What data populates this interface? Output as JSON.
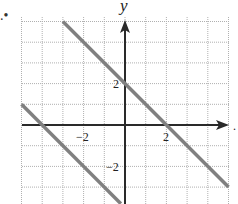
{
  "problem": {
    "bullet": ".•",
    "trailing_mark": "."
  },
  "axes": {
    "y_label": "y",
    "x_ticks": [
      {
        "value": -2,
        "label": "−2"
      },
      {
        "value": 2,
        "label": "2"
      }
    ],
    "y_ticks": [
      {
        "value": 2,
        "label": "2"
      },
      {
        "value": -2,
        "label": "−2"
      }
    ]
  },
  "chart_data": {
    "type": "line",
    "title": "",
    "xlabel": "",
    "ylabel": "y",
    "xlim": [
      -5,
      5
    ],
    "ylim": [
      -3.8,
      5
    ],
    "grid": true,
    "grid_step": 1,
    "x_tick_labels": [
      "-2",
      "2"
    ],
    "y_tick_labels": [
      "2",
      "-2"
    ],
    "series": [
      {
        "name": "upper line",
        "equation": "y = -x + 2",
        "points": [
          [
            -3,
            5
          ],
          [
            5,
            -3
          ]
        ],
        "color": "#808080"
      },
      {
        "name": "lower line",
        "equation": "y = -x - 4",
        "points": [
          [
            -5,
            1
          ],
          [
            -0.2,
            -3.8
          ]
        ],
        "color": "#808080"
      }
    ]
  },
  "colors": {
    "grid": "#b0b0b0",
    "axis": "#2a2a2a",
    "line": "#7a7a7a"
  }
}
